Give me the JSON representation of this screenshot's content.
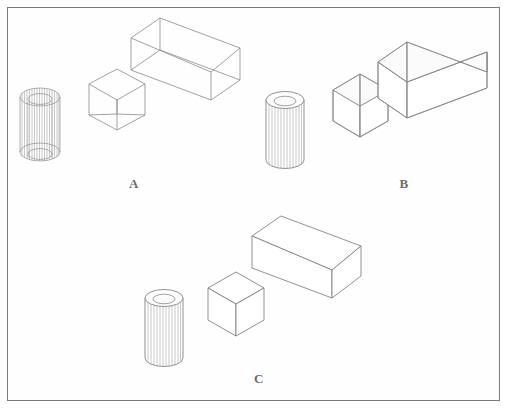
{
  "figure": {
    "background_color": "#fefefe",
    "frame_color": "#7b7b7b",
    "line_color": "#8a8a8a",
    "line_color_dark": "#6f6f6f",
    "fill_color": "#ffffff",
    "label_color": "#6d6d6d",
    "caption": ""
  },
  "groups": [
    {
      "id": "a",
      "label": "A",
      "style_name": "wireframe-transparent",
      "objects": [
        {
          "name": "cylinder",
          "render": "wireframe-hollow-tube",
          "fluted": true
        },
        {
          "name": "cube",
          "render": "wireframe-transparent"
        },
        {
          "name": "box",
          "render": "wireframe-transparent"
        }
      ]
    },
    {
      "id": "b",
      "label": "B",
      "style_name": "opaque-open-container",
      "objects": [
        {
          "name": "cylinder",
          "render": "opaque-hollow-tube",
          "fluted": true
        },
        {
          "name": "cube",
          "render": "opaque-open-top-box"
        },
        {
          "name": "box",
          "render": "opaque-open-top-box"
        }
      ]
    },
    {
      "id": "c",
      "label": "C",
      "style_name": "opaque-solid-closed",
      "objects": [
        {
          "name": "cylinder",
          "render": "opaque-hollow-tube",
          "fluted": true
        },
        {
          "name": "cube",
          "render": "opaque-solid-cube"
        },
        {
          "name": "box",
          "render": "opaque-solid-box"
        }
      ]
    }
  ],
  "labels": {
    "a": "A",
    "b": "B",
    "c": "C"
  }
}
